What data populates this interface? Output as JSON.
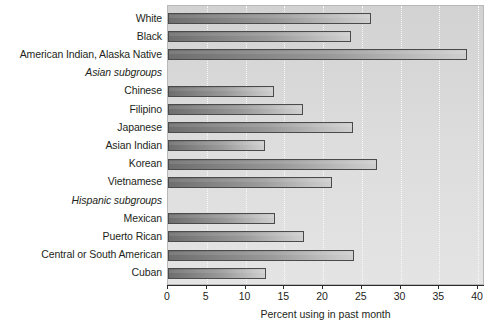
{
  "chart_data": {
    "type": "bar",
    "orientation": "horizontal",
    "title": "",
    "xlabel": "Percent using in past month",
    "ylabel": "",
    "xlim": [
      0,
      40
    ],
    "xticks": [
      0,
      5,
      10,
      15,
      20,
      25,
      30,
      35,
      40
    ],
    "grid": "vertical-dotted",
    "legend": "none",
    "categories": [
      "White",
      "Black",
      "American Indian, Alaska Native",
      "Asian subgroups",
      "Chinese",
      "Filipino",
      "Japanese",
      "Asian Indian",
      "Korean",
      "Vietnamese",
      "Hispanic subgroups",
      "Mexican",
      "Puerto Rican",
      "Central or South American",
      "Cuban"
    ],
    "group_headers": [
      "Asian subgroups",
      "Hispanic subgroups"
    ],
    "values": [
      26.2,
      23.6,
      38.6,
      null,
      13.7,
      17.4,
      23.9,
      12.5,
      27.0,
      21.2,
      null,
      13.8,
      17.5,
      24.0,
      12.6
    ],
    "rows": [
      {
        "label": "White",
        "value": 26.2,
        "is_header": false
      },
      {
        "label": "Black",
        "value": 23.6,
        "is_header": false
      },
      {
        "label": "American Indian, Alaska Native",
        "value": 38.6,
        "is_header": false
      },
      {
        "label": "Asian subgroups",
        "value": null,
        "is_header": true
      },
      {
        "label": "Chinese",
        "value": 13.7,
        "is_header": false
      },
      {
        "label": "Filipino",
        "value": 17.4,
        "is_header": false
      },
      {
        "label": "Japanese",
        "value": 23.9,
        "is_header": false
      },
      {
        "label": "Asian Indian",
        "value": 12.5,
        "is_header": false
      },
      {
        "label": "Korean",
        "value": 27.0,
        "is_header": false
      },
      {
        "label": "Vietnamese",
        "value": 21.2,
        "is_header": false
      },
      {
        "label": "Hispanic subgroups",
        "value": null,
        "is_header": true
      },
      {
        "label": "Mexican",
        "value": 13.8,
        "is_header": false
      },
      {
        "label": "Puerto Rican",
        "value": 17.5,
        "is_header": false
      },
      {
        "label": "Central or South American",
        "value": 24.0,
        "is_header": false
      },
      {
        "label": "Cuban",
        "value": 12.6,
        "is_header": false
      }
    ],
    "colors": {
      "bar_dark": "#6e6e6e",
      "bar_light": "#cfcfcf",
      "bar_border": "#4a4a4a",
      "plot_background": "#dcdcdc",
      "gridline": "#ffffff",
      "axis": "#2b2b2b",
      "text": "#231f20",
      "page_background": "#ffffff"
    }
  }
}
